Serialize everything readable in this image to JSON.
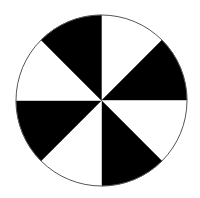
{
  "figure": {
    "type": "sector-wheel",
    "center": [
      101.5,
      100.5
    ],
    "radius": 85.5,
    "outline_color": "#555555",
    "sector_count": 8,
    "sectors": [
      {
        "start_deg": 0,
        "end_deg": 45,
        "color": "#ffffff"
      },
      {
        "start_deg": 45,
        "end_deg": 90,
        "color": "#000000"
      },
      {
        "start_deg": 90,
        "end_deg": 135,
        "color": "#ffffff"
      },
      {
        "start_deg": 135,
        "end_deg": 180,
        "color": "#000000"
      },
      {
        "start_deg": 180,
        "end_deg": 225,
        "color": "#ffffff"
      },
      {
        "start_deg": 225,
        "end_deg": 270,
        "color": "#000000"
      },
      {
        "start_deg": 270,
        "end_deg": 315,
        "color": "#ffffff"
      },
      {
        "start_deg": 315,
        "end_deg": 360,
        "color": "#000000"
      }
    ]
  }
}
